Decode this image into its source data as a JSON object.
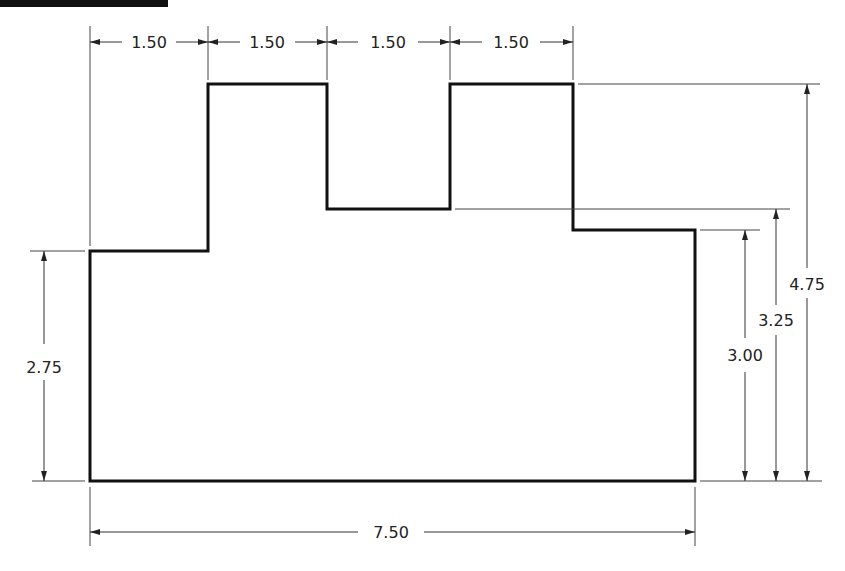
{
  "drawing": {
    "type": "dimensioned-profile",
    "units": "in",
    "outline_color": "#111111",
    "line_color": "#333333",
    "top_dimensions": [
      {
        "label": "1.50",
        "from_x": 90,
        "to_x": 208
      },
      {
        "label": "1.50",
        "from_x": 208,
        "to_x": 327
      },
      {
        "label": "1.50",
        "from_x": 327,
        "to_x": 450
      },
      {
        "label": "1.50",
        "from_x": 450,
        "to_x": 573
      }
    ],
    "left_dimension": {
      "label": "2.75"
    },
    "bottom_dimension": {
      "label": "7.50"
    },
    "right_dimensions": [
      {
        "label": "3.00"
      },
      {
        "label": "3.25"
      },
      {
        "label": "4.75"
      }
    ]
  }
}
